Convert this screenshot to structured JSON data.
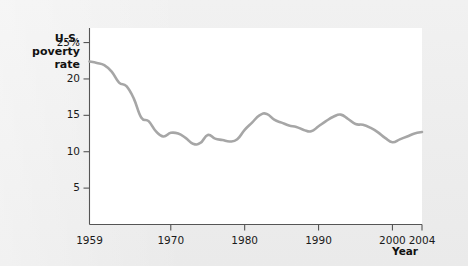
{
  "chart_data": {
    "type": "line",
    "title": "",
    "xlabel": "Year",
    "ylabel": "U.S. poverty rate",
    "ylabel_lines": [
      "U.S.",
      "poverty",
      "rate"
    ],
    "xlim": [
      1959,
      2004
    ],
    "ylim": [
      0,
      27
    ],
    "grid": false,
    "legend": "none",
    "line_color": "#a6a6a6",
    "plot_background": "#ffffff",
    "page_background": "#eeeeee",
    "y_ticks": [
      {
        "value": 25,
        "label": "25%"
      },
      {
        "value": 20,
        "label": "20"
      },
      {
        "value": 15,
        "label": "15"
      },
      {
        "value": 10,
        "label": "10"
      },
      {
        "value": 5,
        "label": "5"
      }
    ],
    "x_ticks": [
      {
        "value": 1959,
        "label": "1959"
      },
      {
        "value": 1970,
        "label": "1970"
      },
      {
        "value": 1980,
        "label": "1980"
      },
      {
        "value": 1990,
        "label": "1990"
      },
      {
        "value": 2000,
        "label": "2000"
      },
      {
        "value": 2004,
        "label": "2004"
      }
    ],
    "x": [
      1959,
      1960,
      1961,
      1962,
      1963,
      1964,
      1965,
      1966,
      1967,
      1968,
      1969,
      1970,
      1971,
      1972,
      1973,
      1974,
      1975,
      1976,
      1977,
      1978,
      1979,
      1980,
      1981,
      1982,
      1983,
      1984,
      1985,
      1986,
      1987,
      1988,
      1989,
      1990,
      1991,
      1992,
      1993,
      1994,
      1995,
      1996,
      1997,
      1998,
      1999,
      2000,
      2001,
      2002,
      2003,
      2004
    ],
    "values": [
      22.4,
      22.2,
      21.9,
      21.0,
      19.5,
      19.0,
      17.3,
      14.7,
      14.2,
      12.8,
      12.1,
      12.6,
      12.5,
      11.9,
      11.1,
      11.2,
      12.3,
      11.8,
      11.6,
      11.4,
      11.7,
      13.0,
      14.0,
      15.0,
      15.2,
      14.4,
      14.0,
      13.6,
      13.4,
      13.0,
      12.8,
      13.5,
      14.2,
      14.8,
      15.1,
      14.5,
      13.8,
      13.7,
      13.3,
      12.7,
      11.9,
      11.3,
      11.7,
      12.1,
      12.5,
      12.7
    ],
    "series_name": "U.S. poverty rate"
  }
}
